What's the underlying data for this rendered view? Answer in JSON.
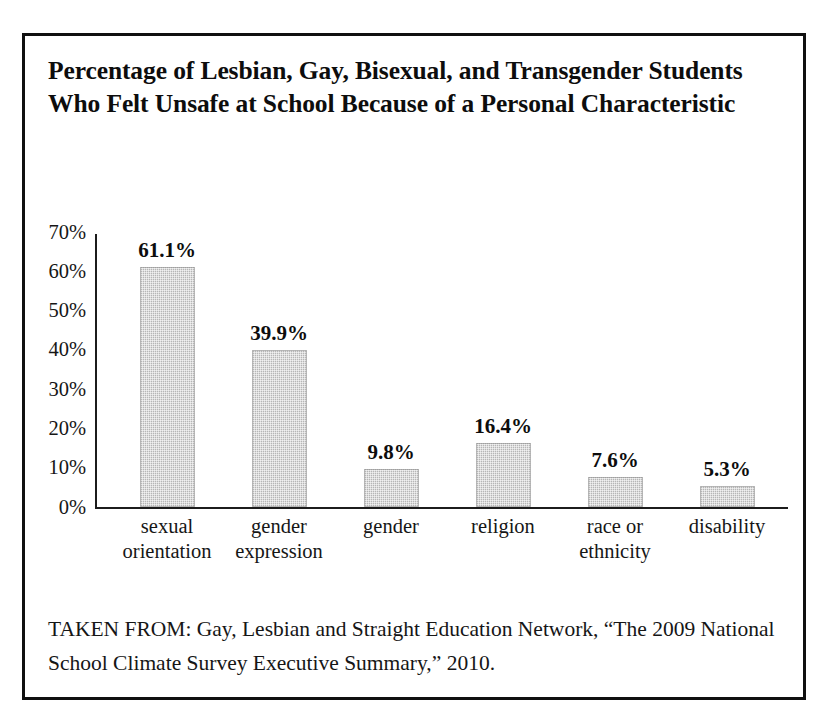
{
  "figure": {
    "title": "Percentage of Lesbian, Gay, Bisexual, and Transgender Students Who Felt Unsafe at School Because of a Personal Characteristic",
    "source_note": "TAKEN FROM: Gay, Lesbian and Straight Education Network, “The 2009 National School Climate Survey Executive Summary,” 2010.",
    "border_color": "#101010",
    "bar_color": "#b6b6b6",
    "axis_color": "#1c1c1c"
  },
  "chart_data": {
    "type": "bar",
    "title": "Percentage of Lesbian, Gay, Bisexual, and Transgender Students Who Felt Unsafe at School Because of a Personal Characteristic",
    "xlabel": "",
    "ylabel": "",
    "ylim": [
      0,
      70
    ],
    "grid": false,
    "legend": null,
    "categories": [
      "sexual orientation",
      "gender expression",
      "gender",
      "religion",
      "race or ethnicity",
      "disability"
    ],
    "category_lines": [
      [
        "sexual",
        "orientation"
      ],
      [
        "gender",
        "expression"
      ],
      [
        "gender",
        ""
      ],
      [
        "religion",
        ""
      ],
      [
        "race or",
        "ethnicity"
      ],
      [
        "disability",
        ""
      ]
    ],
    "values": [
      61.1,
      39.9,
      9.8,
      16.4,
      7.6,
      5.3
    ],
    "value_labels": [
      "61.1%",
      "39.9%",
      "9.8%",
      "16.4%",
      "7.6%",
      "5.3%"
    ],
    "yticks": [
      0,
      10,
      20,
      30,
      40,
      50,
      60,
      70
    ],
    "ytick_labels": [
      "0%",
      "10%",
      "20%",
      "30%",
      "40%",
      "50%",
      "60%",
      "70%"
    ]
  }
}
